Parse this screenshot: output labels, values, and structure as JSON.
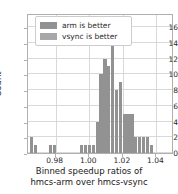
{
  "chart_data": {
    "type": "bar",
    "title": "",
    "subtitle": "",
    "xlabel": "Binned speedup ratios of hmcs-arm over hmcs-vsync",
    "xlabel_line1": "Binned speedup ratios of",
    "xlabel_line2": "hmcs-arm over hmcs-vsync",
    "ylabel": "Count",
    "xlim": [
      0.9635,
      1.0505
    ],
    "ylim": [
      0,
      17.8
    ],
    "xticks": [
      0.98,
      1.0,
      1.02,
      1.04
    ],
    "xticklabels": [
      "0.98",
      "1.00",
      "1.02",
      "1.04"
    ],
    "yticks": [
      0,
      2,
      4,
      6,
      8,
      10,
      12,
      14,
      16
    ],
    "yticklabels": [
      "0",
      "2",
      "4",
      "6",
      "8",
      "10",
      "12",
      "14",
      "16"
    ],
    "grid": true,
    "legend_position": "upper left",
    "bar_color": "#929292",
    "bin_width": 0.0023,
    "categories": [
      0.9658,
      0.9681,
      0.9704,
      0.9727,
      0.975,
      0.9773,
      0.9796,
      0.9819,
      0.9842,
      0.9865,
      0.9888,
      0.9911,
      0.9934,
      0.9957,
      0.998,
      1.0003,
      1.0026,
      1.0049,
      1.0072,
      1.0095,
      1.0118,
      1.0141,
      1.0164,
      1.0187,
      1.021,
      1.0233,
      1.0256,
      1.0279,
      1.0302,
      1.0325,
      1.0348,
      1.0371,
      1.0394,
      1.0417,
      1.044,
      1.0463,
      1.0486
    ],
    "values": [
      2,
      1,
      0,
      0,
      0,
      1,
      1,
      0,
      0,
      0,
      0,
      0,
      0,
      1,
      1,
      1,
      1,
      4,
      10,
      12,
      11,
      17,
      8,
      9,
      5,
      5,
      5,
      2,
      2,
      2,
      2,
      1,
      0,
      0,
      0,
      0,
      0
    ],
    "series": [
      {
        "name": "arm is better",
        "color": "#929292"
      },
      {
        "name": "vsync is better",
        "color": "#a8a8a8"
      }
    ],
    "legend": [
      {
        "label": "arm is better",
        "color": "#929292"
      },
      {
        "label": "vsync is better",
        "color": "#a8a8a8"
      }
    ]
  }
}
